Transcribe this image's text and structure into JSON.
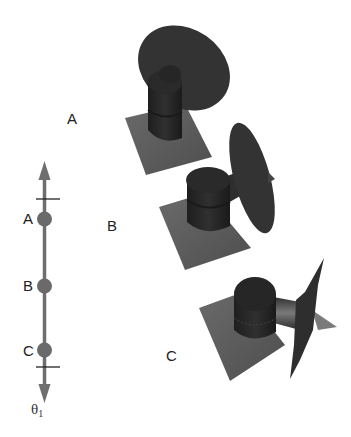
{
  "axis": {
    "label": "θ",
    "label_subscript": "1",
    "color": "#6e6e6e",
    "points": [
      {
        "name": "A",
        "label": "A"
      },
      {
        "name": "B",
        "label": "B"
      },
      {
        "name": "C",
        "label": "C"
      }
    ]
  },
  "configurations": [
    {
      "name": "A",
      "label": "A"
    },
    {
      "name": "B",
      "label": "B"
    },
    {
      "name": "C",
      "label": "C"
    }
  ],
  "colors": {
    "background": "#ffffff",
    "plate": "#5a5a5a",
    "cylinder": "#2a2a2a",
    "disk": "#333333",
    "axis_line": "#6e6e6e",
    "tick": "#222222"
  }
}
